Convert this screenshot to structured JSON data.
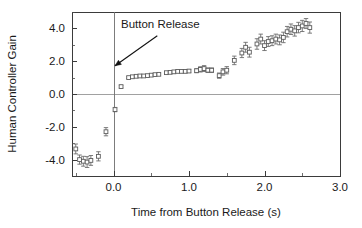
{
  "chart_data": {
    "type": "scatter",
    "title": "",
    "xlabel": "Time from Button Release (s)",
    "ylabel": "Human Controller Gain",
    "xlim": [
      -0.55,
      3.0
    ],
    "ylim": [
      -5.0,
      5.0
    ],
    "xticks": [
      "0.0",
      "1.0",
      "2.0",
      "3.0"
    ],
    "xtick_values": [
      0.0,
      1.0,
      2.0,
      3.0
    ],
    "yticks": [
      "4.0",
      "2.0",
      "0.0",
      "-2.0",
      "-4.0"
    ],
    "ytick_values": [
      4.0,
      2.0,
      0.0,
      -2.0,
      -4.0
    ],
    "grid": false,
    "legend": "none",
    "zero_line": true,
    "event_line_x": 0.0,
    "annotations": [
      {
        "text": "Button Release",
        "text_x": 0.62,
        "text_y": 4.05,
        "arrow_from_x": 0.58,
        "arrow_from_y": 3.55,
        "arrow_to_x": 0.02,
        "arrow_to_y": 1.72
      }
    ],
    "marker_style": "open-square",
    "errorbar_style": "vertical-capped",
    "series": [
      {
        "name": "Human Controller Gain",
        "x": [
          -0.5,
          -0.45,
          -0.4,
          -0.35,
          -0.3,
          -0.2,
          -0.1,
          0.02,
          0.1,
          0.2,
          0.25,
          0.3,
          0.35,
          0.4,
          0.45,
          0.5,
          0.55,
          0.6,
          0.7,
          0.75,
          0.8,
          0.85,
          0.9,
          0.95,
          1.0,
          1.1,
          1.15,
          1.2,
          1.25,
          1.3,
          1.4,
          1.45,
          1.5,
          1.6,
          1.7,
          1.75,
          1.8,
          1.9,
          1.95,
          2.0,
          2.05,
          2.1,
          2.15,
          2.2,
          2.25,
          2.3,
          2.35,
          2.4,
          2.45,
          2.5,
          2.55,
          2.6
        ],
        "y": [
          -3.35,
          -4.0,
          -4.1,
          -4.15,
          -4.05,
          -3.8,
          -2.3,
          -0.95,
          0.45,
          1.0,
          1.05,
          1.08,
          1.1,
          1.1,
          1.12,
          1.15,
          1.18,
          1.2,
          1.3,
          1.32,
          1.35,
          1.38,
          1.38,
          1.38,
          1.4,
          1.42,
          1.5,
          1.55,
          1.45,
          1.45,
          1.12,
          1.35,
          1.45,
          2.05,
          2.5,
          2.85,
          2.55,
          3.05,
          3.35,
          2.95,
          3.2,
          3.25,
          3.35,
          3.3,
          3.45,
          3.8,
          3.95,
          3.85,
          4.05,
          4.15,
          4.3,
          4.05
        ],
        "yerr": [
          0.3,
          0.28,
          0.3,
          0.33,
          0.3,
          0.28,
          0.25,
          0.13,
          0.08,
          0.06,
          0.05,
          0.05,
          0.05,
          0.05,
          0.05,
          0.05,
          0.06,
          0.06,
          0.07,
          0.07,
          0.08,
          0.08,
          0.08,
          0.08,
          0.09,
          0.12,
          0.16,
          0.18,
          0.14,
          0.14,
          0.16,
          0.2,
          0.22,
          0.26,
          0.28,
          0.3,
          0.3,
          0.32,
          0.3,
          0.3,
          0.3,
          0.3,
          0.3,
          0.3,
          0.32,
          0.32,
          0.32,
          0.32,
          0.32,
          0.34,
          0.3,
          0.34
        ]
      }
    ]
  },
  "figure": {
    "plot_area": {
      "left": 72,
      "top": 12,
      "right": 340,
      "bottom": 176
    }
  }
}
